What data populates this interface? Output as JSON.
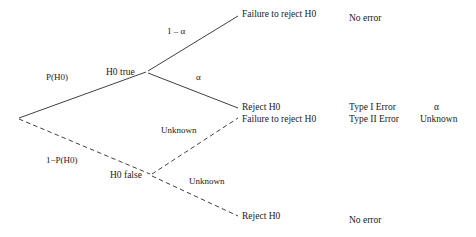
{
  "diagram": {
    "type": "decision-tree",
    "root": {
      "label": ""
    },
    "nodes": {
      "h0_true": "H0 true",
      "h0_false": "H0 false"
    },
    "edges": {
      "root_to_true": "P(H0)",
      "root_to_false": "1−P(H0)",
      "true_to_fail_reject": "1 – α",
      "true_to_reject": "α",
      "false_to_fail_reject": "Unknown",
      "false_to_reject": "Unknown"
    },
    "leaves": [
      {
        "decision": "Failure to reject H0",
        "outcome": "No error",
        "rate": ""
      },
      {
        "decision": "Reject H0",
        "outcome": "Type I Error",
        "rate": "α"
      },
      {
        "decision": "Failure to reject H0",
        "outcome": "Type II Error",
        "rate": "Unknown"
      },
      {
        "decision": "Reject H0",
        "outcome": "No error",
        "rate": ""
      }
    ],
    "colors": {
      "background": "#ffffff",
      "text": "#1a1a1a",
      "line": "#2a2a2a"
    }
  }
}
